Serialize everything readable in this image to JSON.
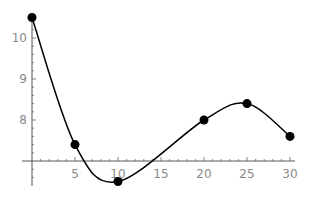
{
  "chart_data": {
    "type": "line",
    "title": "",
    "xlabel": "",
    "ylabel": "",
    "points": [
      {
        "x": 0,
        "y": 10.5
      },
      {
        "x": 5,
        "y": 7.4
      },
      {
        "x": 10,
        "y": 6.5
      },
      {
        "x": 20,
        "y": 8.0
      },
      {
        "x": 25,
        "y": 8.4
      },
      {
        "x": 30,
        "y": 7.6
      }
    ],
    "x": [
      0,
      5,
      10,
      20,
      25,
      30
    ],
    "values": [
      10.5,
      7.4,
      6.5,
      8.0,
      8.4,
      7.6
    ],
    "curve": "smooth interpolating curve through data points",
    "x_ticks": [
      "5",
      "10",
      "15",
      "20",
      "25",
      "30"
    ],
    "y_ticks": [
      "8",
      "9",
      "10"
    ],
    "axis_origin": {
      "x": 0,
      "y": 7
    },
    "xlim": [
      0,
      30
    ],
    "ylim": [
      6.5,
      10.5
    ],
    "grid": false,
    "legend": null
  },
  "colors": {
    "curve": "#000000",
    "points": "#000000",
    "axis": "#555555",
    "tick_label": "#8a8a8a"
  }
}
